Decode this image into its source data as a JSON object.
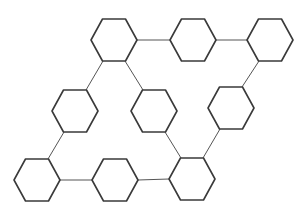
{
  "diagram": {
    "type": "hexagon-network",
    "stroke_color": "#3a3a3a",
    "connector_color": "#555555",
    "background": "#ffffff",
    "hex_half_width": 23,
    "hex_half_height": 21,
    "nodes": [
      {
        "id": "h1",
        "cx": 114,
        "cy": 40
      },
      {
        "id": "h2",
        "cx": 193,
        "cy": 40
      },
      {
        "id": "h3",
        "cx": 270,
        "cy": 40
      },
      {
        "id": "h4",
        "cx": 75,
        "cy": 111
      },
      {
        "id": "h5",
        "cx": 154,
        "cy": 111
      },
      {
        "id": "h6",
        "cx": 231,
        "cy": 108
      },
      {
        "id": "h7",
        "cx": 37,
        "cy": 180
      },
      {
        "id": "h8",
        "cx": 115,
        "cy": 180
      },
      {
        "id": "h9",
        "cx": 192,
        "cy": 179
      }
    ],
    "edges": [
      {
        "from": "h1",
        "to": "h2",
        "x1": 137,
        "y1": 40,
        "x2": 170,
        "y2": 40
      },
      {
        "from": "h2",
        "to": "h3",
        "x1": 216,
        "y1": 40,
        "x2": 247,
        "y2": 40
      },
      {
        "from": "h1",
        "to": "h4",
        "x1": 103,
        "y1": 61,
        "x2": 86,
        "y2": 90
      },
      {
        "from": "h1",
        "to": "h5",
        "x1": 125,
        "y1": 61,
        "x2": 143,
        "y2": 90
      },
      {
        "from": "h3",
        "to": "h6",
        "x1": 259,
        "y1": 61,
        "x2": 242,
        "y2": 87
      },
      {
        "from": "h4",
        "to": "h7",
        "x1": 64,
        "y1": 132,
        "x2": 48,
        "y2": 159
      },
      {
        "from": "h7",
        "to": "h8",
        "x1": 60,
        "y1": 180,
        "x2": 92,
        "y2": 180
      },
      {
        "from": "h8",
        "to": "h9",
        "x1": 138,
        "y1": 180,
        "x2": 169,
        "y2": 179
      },
      {
        "from": "h5",
        "to": "h9",
        "x1": 165,
        "y1": 132,
        "x2": 181,
        "y2": 158
      },
      {
        "from": "h6",
        "to": "h9",
        "x1": 220,
        "y1": 129,
        "x2": 203,
        "y2": 158
      }
    ]
  }
}
